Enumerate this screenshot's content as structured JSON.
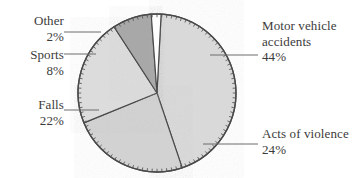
{
  "chart_data": {
    "type": "pie",
    "title": "",
    "subtitle": "",
    "xlabel": "",
    "ylabel": "",
    "legend_position": "callout-labels",
    "grid": false,
    "total_percent": 100,
    "categories": [
      "Motor vehicle accidents",
      "Acts of violence",
      "Falls",
      "Sports",
      "Other"
    ],
    "values": [
      44,
      24,
      22,
      8,
      2
    ],
    "value_labels": [
      "44%",
      "24%",
      "22%",
      "8%",
      "2%"
    ],
    "slices": [
      {
        "name": "Motor vehicle accidents",
        "label_line1": "Motor vehicle",
        "label_line2": "accidents",
        "percent_label": "44%",
        "value": 44,
        "fill": "#d9d9d9",
        "start_angle": 3,
        "end_angle": 161
      },
      {
        "name": "Acts of violence",
        "label_line1": "Acts of violence",
        "label_line2": "",
        "percent_label": "24%",
        "value": 24,
        "fill": "#d2d2d2",
        "start_angle": 161,
        "end_angle": 248
      },
      {
        "name": "Falls",
        "label_line1": "Falls",
        "label_line2": "",
        "percent_label": "22%",
        "value": 22,
        "fill": "#dcdcdc",
        "start_angle": 248,
        "end_angle": 327
      },
      {
        "name": "Sports",
        "label_line1": "Sports",
        "label_line2": "",
        "percent_label": "8%",
        "value": 8,
        "fill": "#a8a8a8",
        "start_angle": 327,
        "end_angle": 356
      },
      {
        "name": "Other",
        "label_line1": "Other",
        "label_line2": "",
        "percent_label": "2%",
        "value": 2,
        "fill": "#fdfdfd",
        "start_angle": 356,
        "end_angle": 363
      }
    ],
    "style": {
      "rim_ticks": true,
      "rim_tick_count": 100,
      "outline_color": "#4a4a4a",
      "label_color": "#3b3b3b",
      "background": "#ffffff"
    }
  },
  "labels": {
    "other": {
      "name": "Other",
      "percent": "2%"
    },
    "sports": {
      "name": "Sports",
      "percent": "8%"
    },
    "falls": {
      "name": "Falls",
      "percent": "22%"
    },
    "motor": {
      "name_line1": "Motor vehicle",
      "name_line2": "accidents",
      "percent": "44%"
    },
    "violence": {
      "name": "Acts of violence",
      "percent": "24%"
    }
  }
}
